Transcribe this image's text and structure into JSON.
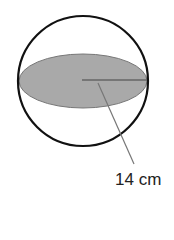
{
  "diagram": {
    "shapes": [
      "sphere outline",
      "shaded cross-section ellipse",
      "radius line"
    ],
    "radius_label": "14 cm",
    "colors": {
      "outline": "#111111",
      "fill": "#a9a9a9",
      "leader": "#666666"
    }
  }
}
